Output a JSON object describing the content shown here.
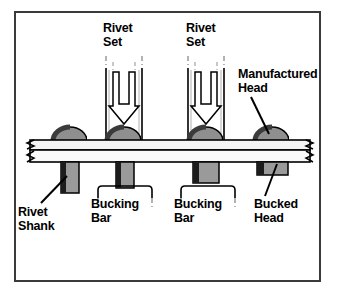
{
  "figure": {
    "frame": {
      "border_color": "#3a3a3a",
      "background": "#ffffff"
    }
  },
  "colors": {
    "outline": "#000000",
    "head_dark": "#4a4a4a",
    "head_light": "#8f8f8f",
    "shank_fill": "#9a9a9a",
    "shank_edge": "#1a1a1a",
    "sheet_fill": "#f2f2f2",
    "tool_fill": "#ffffff",
    "break_line": "#7a7a7a",
    "text": "#000000"
  },
  "labels": [
    {
      "id": "rivet-set-1",
      "text": "Rivet\nSet",
      "x": 103,
      "y": 22
    },
    {
      "id": "rivet-set-2",
      "text": "Rivet\nSet",
      "x": 186,
      "y": 22
    },
    {
      "id": "manufactured-head",
      "text": "Manufactured\nHead",
      "x": 238,
      "y": 68
    },
    {
      "id": "rivet-shank",
      "text": "Rivet\nShank",
      "x": 18,
      "y": 206
    },
    {
      "id": "bucking-bar-1",
      "text": "Bucking\nBar",
      "x": 91,
      "y": 198
    },
    {
      "id": "bucking-bar-2",
      "text": "Bucking\nBar",
      "x": 174,
      "y": 198
    },
    {
      "id": "bucked-head",
      "text": "Bucked\nHead",
      "x": 254,
      "y": 198
    }
  ],
  "geometry": {
    "sheet": {
      "left": 27,
      "right": 312,
      "top_plate_y": 140,
      "top_plate_h": 9,
      "bottom_plate_y": 149,
      "bottom_plate_h": 12,
      "break_symbols": 2
    },
    "rivets": [
      {
        "id": "rivet-1",
        "cx": 70,
        "head_rx": 17,
        "head_ry": 13,
        "shank_x": 61,
        "shank_w": 17,
        "shank_h": 33,
        "state": "unformed",
        "tool": false,
        "bar": false,
        "bucked": false
      },
      {
        "id": "rivet-2",
        "cx": 124,
        "head_rx": 17,
        "head_ry": 13,
        "shank_x": 115,
        "shank_w": 17,
        "shank_h": 28,
        "state": "being-driven",
        "tool": true,
        "bar": true,
        "bucked": false
      },
      {
        "id": "rivet-3",
        "cx": 206,
        "head_rx": 17,
        "head_ry": 13,
        "shank_x": 193,
        "shank_w": 25,
        "shank_h": 20,
        "state": "upsetting",
        "tool": true,
        "bar": true,
        "bucked": false
      },
      {
        "id": "rivet-4",
        "cx": 272,
        "head_rx": 17,
        "head_ry": 13,
        "shank_x": 257,
        "shank_w": 30,
        "shank_h": 13,
        "state": "complete",
        "tool": false,
        "bar": false,
        "bucked": true
      }
    ],
    "rivet_sets": [
      {
        "id": "rivet-set-tool-1",
        "cx": 124,
        "left_x": 104,
        "right_x": 144,
        "top_y": 56,
        "bottom_y": 140,
        "arrow_top": 72,
        "arrow_tip": 123
      },
      {
        "id": "rivet-set-tool-2",
        "cx": 206,
        "left_x": 186,
        "right_x": 226,
        "top_y": 56,
        "bottom_y": 140,
        "arrow_top": 72,
        "arrow_tip": 123
      }
    ],
    "bucking_bars": [
      {
        "id": "bucking-bar-shape-1",
        "left_x": 98,
        "right_x": 152,
        "top_y": 186,
        "bottom_y": 196
      },
      {
        "id": "bucking-bar-shape-2",
        "left_x": 180,
        "right_x": 234,
        "top_y": 186,
        "bottom_y": 196
      }
    ],
    "leaders": [
      {
        "id": "leader-manufactured-head",
        "x1": 251,
        "y1": 97,
        "x2": 268,
        "y2": 133
      },
      {
        "id": "leader-rivet-shank",
        "x1": 40,
        "y1": 203,
        "x2": 66,
        "y2": 178
      },
      {
        "id": "leader-bucked-head",
        "x1": 265,
        "y1": 196,
        "x2": 276,
        "y2": 163
      }
    ]
  }
}
